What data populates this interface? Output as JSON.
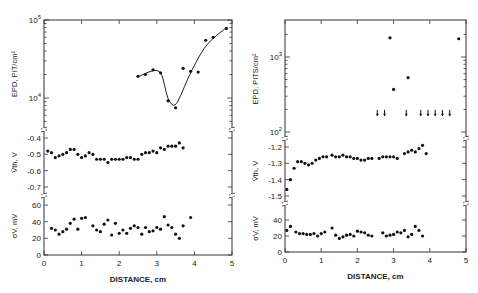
{
  "chart_data": [
    {
      "type": "scatter",
      "panel": "left",
      "xlabel": "DISTANCE, cm",
      "xlim": [
        0,
        5
      ],
      "xticks": [
        "0",
        "1",
        "2",
        "3",
        "4",
        "5"
      ],
      "subplots": [
        {
          "ylabel": "EPD, PIT/cm²",
          "yscale": "log",
          "ylim": [
            4000,
            100000
          ],
          "yticks": [
            "10^4",
            "10^5"
          ],
          "fit_curve": true,
          "points": [
            [
              2.5,
              19000
            ],
            [
              2.7,
              20000
            ],
            [
              2.9,
              23000
            ],
            [
              3.1,
              21000
            ],
            [
              3.3,
              9200
            ],
            [
              3.5,
              7500
            ],
            [
              3.7,
              24000
            ],
            [
              3.9,
              22000
            ],
            [
              4.1,
              21500
            ],
            [
              4.3,
              55000
            ],
            [
              4.5,
              60000
            ],
            [
              4.85,
              78000
            ]
          ]
        },
        {
          "ylabel": "V̄th, V",
          "ylim": [
            -0.74,
            -0.38
          ],
          "yticks": [
            "-0.4",
            "-0.5",
            "-0.6",
            "-0.7"
          ],
          "points": [
            [
              0.1,
              -0.48
            ],
            [
              0.2,
              -0.49
            ],
            [
              0.3,
              -0.52
            ],
            [
              0.4,
              -0.51
            ],
            [
              0.5,
              -0.5
            ],
            [
              0.6,
              -0.49
            ],
            [
              0.7,
              -0.47
            ],
            [
              0.8,
              -0.47
            ],
            [
              0.9,
              -0.5
            ],
            [
              1.0,
              -0.52
            ],
            [
              1.1,
              -0.51
            ],
            [
              1.2,
              -0.49
            ],
            [
              1.3,
              -0.5
            ],
            [
              1.4,
              -0.53
            ],
            [
              1.5,
              -0.53
            ],
            [
              1.6,
              -0.53
            ],
            [
              1.7,
              -0.55
            ],
            [
              1.8,
              -0.53
            ],
            [
              1.9,
              -0.53
            ],
            [
              2.0,
              -0.53
            ],
            [
              2.1,
              -0.53
            ],
            [
              2.2,
              -0.52
            ],
            [
              2.3,
              -0.52
            ],
            [
              2.4,
              -0.53
            ],
            [
              2.5,
              -0.53
            ],
            [
              2.6,
              -0.5
            ],
            [
              2.7,
              -0.49
            ],
            [
              2.8,
              -0.49
            ],
            [
              2.9,
              -0.48
            ],
            [
              3.0,
              -0.49
            ],
            [
              3.1,
              -0.46
            ],
            [
              3.2,
              -0.47
            ],
            [
              3.3,
              -0.45
            ],
            [
              3.4,
              -0.45
            ],
            [
              3.5,
              -0.45
            ],
            [
              3.6,
              -0.43
            ],
            [
              3.7,
              -0.46
            ]
          ]
        },
        {
          "ylabel": "σV, mV",
          "ylim": [
            0,
            60
          ],
          "yticks": [
            "0",
            "20",
            "40",
            "60"
          ],
          "points": [
            [
              0.2,
              32
            ],
            [
              0.3,
              30
            ],
            [
              0.4,
              25
            ],
            [
              0.5,
              28
            ],
            [
              0.6,
              31
            ],
            [
              0.7,
              38
            ],
            [
              0.8,
              43
            ],
            [
              0.9,
              31
            ],
            [
              1.0,
              44
            ],
            [
              1.1,
              45
            ],
            [
              1.3,
              35
            ],
            [
              1.4,
              30
            ],
            [
              1.5,
              28
            ],
            [
              1.6,
              37
            ],
            [
              1.7,
              42
            ],
            [
              1.8,
              24
            ],
            [
              1.9,
              38
            ],
            [
              2.0,
              26
            ],
            [
              2.1,
              30
            ],
            [
              2.2,
              26
            ],
            [
              2.3,
              32
            ],
            [
              2.4,
              35
            ],
            [
              2.5,
              33
            ],
            [
              2.6,
              25
            ],
            [
              2.7,
              33
            ],
            [
              2.8,
              28
            ],
            [
              2.9,
              29
            ],
            [
              3.0,
              33
            ],
            [
              3.1,
              31
            ],
            [
              3.2,
              46
            ],
            [
              3.3,
              36
            ],
            [
              3.4,
              33
            ],
            [
              3.5,
              25
            ],
            [
              3.6,
              20
            ],
            [
              3.7,
              35
            ],
            [
              3.9,
              45
            ]
          ]
        }
      ]
    },
    {
      "type": "scatter",
      "panel": "right",
      "xlabel": "DISTANCE, cm",
      "xlim": [
        0,
        5
      ],
      "xticks": [
        "0",
        "1",
        "2",
        "3",
        "4",
        "5"
      ],
      "subplots": [
        {
          "ylabel": "EPD, PITS/cm²",
          "yscale": "log",
          "ylim": [
            100,
            2500
          ],
          "yticks": [
            "10^2",
            "10^3"
          ],
          "points": [
            [
              2.9,
              1800
            ],
            [
              3.0,
              370
            ],
            [
              3.4,
              530
            ],
            [
              4.8,
              1750
            ]
          ],
          "upper_limit_arrows": {
            "value": 180,
            "x": [
              2.55,
              2.75,
              3.35,
              3.75,
              3.95,
              4.15,
              4.35,
              4.55
            ]
          }
        },
        {
          "ylabel": "V̄th, V",
          "ylim": [
            -1.55,
            -1.15
          ],
          "yticks": [
            "-1.2",
            "-1.3",
            "-1.4",
            "-1.5"
          ],
          "points": [
            [
              0.05,
              -1.46
            ],
            [
              0.15,
              -1.4
            ],
            [
              0.25,
              -1.33
            ],
            [
              0.35,
              -1.29
            ],
            [
              0.45,
              -1.29
            ],
            [
              0.55,
              -1.3
            ],
            [
              0.65,
              -1.31
            ],
            [
              0.75,
              -1.3
            ],
            [
              0.85,
              -1.28
            ],
            [
              0.95,
              -1.27
            ],
            [
              1.05,
              -1.26
            ],
            [
              1.15,
              -1.26
            ],
            [
              1.3,
              -1.25
            ],
            [
              1.4,
              -1.26
            ],
            [
              1.5,
              -1.26
            ],
            [
              1.6,
              -1.25
            ],
            [
              1.7,
              -1.26
            ],
            [
              1.8,
              -1.26
            ],
            [
              1.9,
              -1.27
            ],
            [
              2.0,
              -1.27
            ],
            [
              2.1,
              -1.28
            ],
            [
              2.2,
              -1.28
            ],
            [
              2.3,
              -1.27
            ],
            [
              2.4,
              -1.27
            ],
            [
              2.6,
              -1.27
            ],
            [
              2.7,
              -1.26
            ],
            [
              2.8,
              -1.26
            ],
            [
              2.9,
              -1.26
            ],
            [
              3.0,
              -1.26
            ],
            [
              3.1,
              -1.27
            ],
            [
              3.3,
              -1.24
            ],
            [
              3.4,
              -1.23
            ],
            [
              3.5,
              -1.22
            ],
            [
              3.6,
              -1.23
            ],
            [
              3.7,
              -1.21
            ],
            [
              3.8,
              -1.19
            ],
            [
              3.9,
              -1.24
            ]
          ]
        },
        {
          "ylabel": "σV, mV",
          "ylim": [
            0,
            50
          ],
          "yticks": [
            "0",
            "20",
            "40"
          ],
          "points": [
            [
              0.05,
              27
            ],
            [
              0.15,
              32
            ],
            [
              0.3,
              25
            ],
            [
              0.4,
              23
            ],
            [
              0.5,
              23
            ],
            [
              0.6,
              22
            ],
            [
              0.7,
              22
            ],
            [
              0.8,
              23
            ],
            [
              0.9,
              20
            ],
            [
              1.0,
              23
            ],
            [
              1.1,
              25
            ],
            [
              1.3,
              30
            ],
            [
              1.4,
              21
            ],
            [
              1.5,
              17
            ],
            [
              1.6,
              19
            ],
            [
              1.7,
              21
            ],
            [
              1.8,
              22
            ],
            [
              1.9,
              20
            ],
            [
              2.0,
              26
            ],
            [
              2.1,
              25
            ],
            [
              2.2,
              24
            ],
            [
              2.3,
              21
            ],
            [
              2.4,
              20
            ],
            [
              2.7,
              24
            ],
            [
              2.8,
              20
            ],
            [
              2.9,
              21
            ],
            [
              3.0,
              22
            ],
            [
              3.1,
              25
            ],
            [
              3.2,
              24
            ],
            [
              3.3,
              27
            ],
            [
              3.4,
              19
            ],
            [
              3.5,
              22
            ],
            [
              3.6,
              32
            ],
            [
              3.7,
              27
            ],
            [
              3.8,
              20
            ]
          ]
        }
      ]
    }
  ],
  "labels": {
    "left_epd": "EPD, PIT/cm²",
    "right_epd": "EPD, PITS/cm²",
    "vth": "V̄th, V",
    "sigma": "σV, mV",
    "xlabel": "DISTANCE, cm"
  }
}
